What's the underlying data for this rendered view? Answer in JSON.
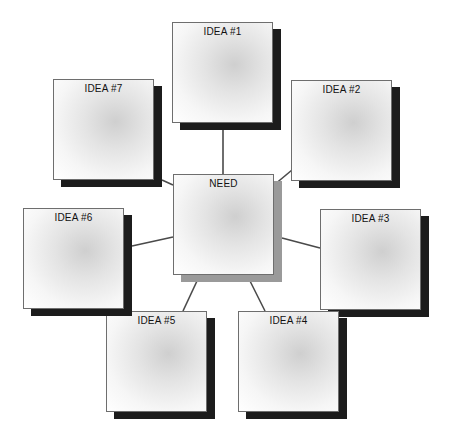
{
  "diagram": {
    "type": "hub-and-spoke idea map",
    "center": {
      "id": "need",
      "label": "NEED",
      "x": 173,
      "y": 174
    },
    "ideas": [
      {
        "id": "idea1",
        "label": "IDEA #1",
        "x": 172,
        "y": 22
      },
      {
        "id": "idea2",
        "label": "IDEA #2",
        "x": 291,
        "y": 80
      },
      {
        "id": "idea3",
        "label": "IDEA #3",
        "x": 320,
        "y": 209
      },
      {
        "id": "idea4",
        "label": "IDEA #4",
        "x": 238,
        "y": 311
      },
      {
        "id": "idea5",
        "label": "IDEA #5",
        "x": 106,
        "y": 311
      },
      {
        "id": "idea6",
        "label": "IDEA #6",
        "x": 23,
        "y": 208
      },
      {
        "id": "idea7",
        "label": "IDEA #7",
        "x": 53,
        "y": 79
      }
    ],
    "connectors": [
      {
        "from": "idea1",
        "to": "need",
        "x1": 223,
        "y1": 130,
        "x2": 223,
        "y2": 174
      },
      {
        "from": "idea2",
        "to": "need",
        "x1": 292,
        "y1": 170,
        "x2": 274,
        "y2": 185
      },
      {
        "from": "idea3",
        "to": "need",
        "x1": 320,
        "y1": 248,
        "x2": 282,
        "y2": 238
      },
      {
        "from": "idea4",
        "to": "need",
        "x1": 265,
        "y1": 311,
        "x2": 250,
        "y2": 281
      },
      {
        "from": "idea5",
        "to": "need",
        "x1": 183,
        "y1": 311,
        "x2": 197,
        "y2": 281
      },
      {
        "from": "idea6",
        "to": "need",
        "x1": 132,
        "y1": 246,
        "x2": 173,
        "y2": 237
      },
      {
        "from": "idea7",
        "to": "need",
        "x1": 162,
        "y1": 180,
        "x2": 173,
        "y2": 185
      }
    ],
    "colors": {
      "line": "#4a4a4a",
      "border": "#6e6e6e",
      "shadow": "#1c1c1c",
      "center_shadow": "#9a9a9a",
      "text": "#111111"
    }
  }
}
